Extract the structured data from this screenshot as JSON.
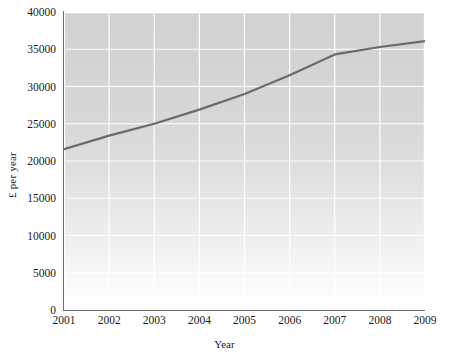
{
  "chart_data": {
    "type": "line",
    "title": "",
    "subtitle": "",
    "xlabel": "Year",
    "ylabel": "£ per year",
    "x": [
      2001,
      2002,
      2003,
      2004,
      2005,
      2006,
      2007,
      2008,
      2009
    ],
    "xtick_labels": [
      "2001",
      "2002",
      "2003",
      "2004",
      "2005",
      "2006",
      "2007",
      "2008",
      "2009"
    ],
    "ytick_labels": [
      "0",
      "5000",
      "10000",
      "15000",
      "20000",
      "25000",
      "30000",
      "35000",
      "40000"
    ],
    "ytick_values": [
      0,
      5000,
      10000,
      15000,
      20000,
      25000,
      30000,
      35000,
      40000
    ],
    "xlim": [
      2001,
      2009
    ],
    "ylim": [
      0,
      40000
    ],
    "grid": true,
    "grid_color": "#ffffff",
    "legend": null,
    "legend_position": "none",
    "series": [
      {
        "name": "£ per year",
        "color": "#6a6a6a",
        "line_width": 2.2,
        "markers": false,
        "values": [
          21600,
          23400,
          25000,
          26900,
          29000,
          31500,
          34300,
          35300,
          36100
        ]
      }
    ],
    "plot_background": {
      "type": "vertical-gradient",
      "top_color": "#d2d2d2",
      "bottom_color": "#ffffff"
    },
    "axis_color": "#6e6e6e",
    "text_color": "#1a1a1a"
  }
}
